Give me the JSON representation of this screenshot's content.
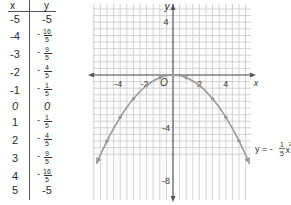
{
  "table": {
    "headers": {
      "x": "x",
      "y": "y"
    },
    "rows": [
      {
        "x": "-5",
        "y": "-5",
        "frac": false
      },
      {
        "x": "-4",
        "y_num": "16",
        "y_den": "5",
        "y_sign": "-",
        "frac": true
      },
      {
        "x": "-3",
        "y_num": "9",
        "y_den": "5",
        "y_sign": "-",
        "frac": true
      },
      {
        "x": "-2",
        "y_num": "4",
        "y_den": "5",
        "y_sign": "-",
        "frac": true
      },
      {
        "x": "-1",
        "y_num": "1",
        "y_den": "5",
        "y_sign": "-",
        "frac": true
      },
      {
        "x": "0",
        "y": "0",
        "frac": false
      },
      {
        "x": "1",
        "y_num": "1",
        "y_den": "5",
        "y_sign": "-",
        "frac": true
      },
      {
        "x": "2",
        "y_num": "4",
        "y_den": "5",
        "y_sign": "-",
        "frac": true
      },
      {
        "x": "3",
        "y_num": "9",
        "y_den": "5",
        "y_sign": "-",
        "frac": true
      },
      {
        "x": "4",
        "y_num": "16",
        "y_den": "5",
        "y_sign": "-",
        "frac": true
      },
      {
        "x": "5",
        "y": "-5",
        "frac": false
      }
    ]
  },
  "graph": {
    "x_axis_label": "x",
    "y_axis_label": "y",
    "origin_label": "O",
    "x_ticks": [
      "-4",
      "-2",
      "2",
      "4"
    ],
    "y_ticks": [
      "4",
      "-4",
      "-8"
    ],
    "equation": {
      "lhs": "y = -",
      "num": "1",
      "den": "5",
      "var": "x",
      "exp": "2"
    },
    "curve_color": "#9a9a9a",
    "grid_color": "#c8c8c8",
    "axis_color": "#555555"
  },
  "chart_data": {
    "type": "line",
    "title": "",
    "function": "y = -1/5 x^2",
    "xlabel": "x",
    "ylabel": "y",
    "x": [
      -5,
      -4,
      -3,
      -2,
      -1,
      0,
      1,
      2,
      3,
      4,
      5
    ],
    "series": [
      {
        "name": "y = -1/5 x^2",
        "values": [
          -5,
          -3.2,
          -1.8,
          -0.8,
          -0.2,
          0,
          -0.2,
          -0.8,
          -1.8,
          -3.2,
          -5
        ]
      }
    ],
    "xlim": [
      -6,
      6
    ],
    "ylim": [
      -9,
      5.5
    ],
    "x_tick_labels": [
      -4,
      -2,
      2,
      4
    ],
    "y_tick_labels": [
      4,
      -4,
      -8
    ],
    "grid": true,
    "grid_step": 0.5,
    "annotations": [
      "O",
      "y = -1/5 x^2"
    ]
  }
}
